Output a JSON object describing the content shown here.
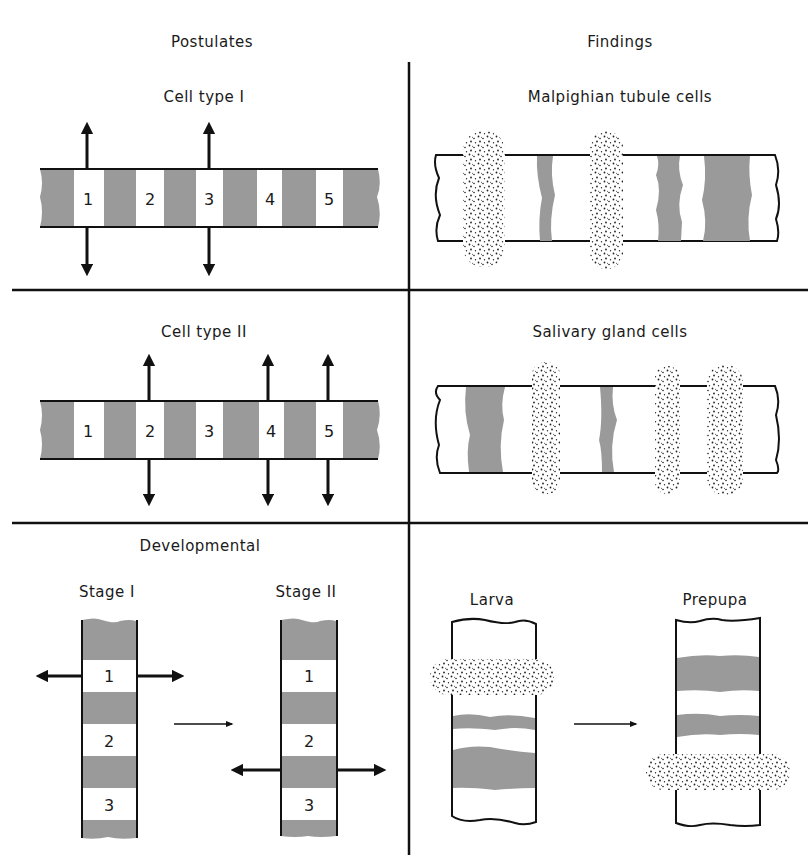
{
  "headers": {
    "left": "Postulates",
    "right": "Findings"
  },
  "colors": {
    "band_gray": "#9a9a9a",
    "line": "#111111",
    "background": "#ffffff"
  },
  "rows": [
    {
      "left": {
        "title": "Cell type I",
        "band_labels": [
          "1",
          "2",
          "3",
          "4",
          "5"
        ],
        "active_bands": [
          "1",
          "3"
        ]
      },
      "right": {
        "title": "Malpighian tubule cells"
      }
    },
    {
      "left": {
        "title": "Cell type II",
        "band_labels": [
          "1",
          "2",
          "3",
          "4",
          "5"
        ],
        "active_bands": [
          "2",
          "4",
          "5"
        ]
      },
      "right": {
        "title": "Salivary gland cells"
      }
    },
    {
      "left": {
        "title": "Developmental",
        "stage1": {
          "title": "Stage I",
          "band_labels": [
            "1",
            "2",
            "3"
          ],
          "active_band": "1"
        },
        "stage2": {
          "title": "Stage II",
          "band_labels": [
            "1",
            "2",
            "3"
          ],
          "active_band": "between 2 and 3"
        }
      },
      "right": {
        "larva": {
          "title": "Larva"
        },
        "prepupa": {
          "title": "Prepupa"
        }
      }
    }
  ]
}
